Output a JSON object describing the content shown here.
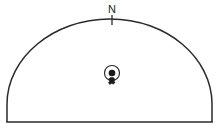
{
  "figure": {
    "background_color": "#ffffff",
    "line_color": "#2a2a2a",
    "marker_fill_color": "#1a1a1a",
    "north_label": "N",
    "width": 222,
    "height": 131
  },
  "chart_data": {
    "type": "diagram",
    "title": "",
    "subtitle": "",
    "xlabel": "",
    "ylabel": "",
    "grid": false,
    "legend": "none",
    "annotations": [
      {
        "name": "north-indicator",
        "text": "N",
        "x": 112,
        "y": 13,
        "tick_x": 112,
        "tick_y1": 15,
        "tick_y2": 24
      }
    ],
    "shapes": [
      {
        "name": "dome-outline",
        "kind": "semicircular-arc",
        "left_base_x": 7,
        "right_base_x": 212,
        "base_y": 122,
        "apex_x": 110,
        "apex_y": 19
      },
      {
        "name": "baseline",
        "kind": "horizontal-line",
        "x1": 7,
        "x2": 212,
        "y": 122
      }
    ],
    "points": [
      {
        "name": "site-marker",
        "kind": "circle-with-center-dot",
        "x": 112,
        "y": 73,
        "radius": 7.5,
        "dot_radius": 3.2
      }
    ]
  },
  "outline": {
    "path": "M 7 122 L 7 104 C 7 58 53 19 110 19 C 167 19 212 58 212 104 L 212 122",
    "baseline_path": "M 7 122 L 212 122"
  },
  "north": {
    "label": "N",
    "label_x": 112,
    "label_y": 13,
    "tick_x": 112,
    "tick_top": 15,
    "tick_bottom": 25
  },
  "marker": {
    "center_x": 112,
    "center_y": 73,
    "ring_radius": 7.5,
    "dot_radius": 3.3,
    "cluster": {
      "x": 112,
      "y": 82,
      "radius": 3.4
    }
  }
}
